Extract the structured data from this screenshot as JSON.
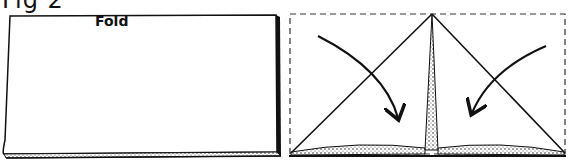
{
  "figure": {
    "title": "Fig 2",
    "panels": [
      {
        "id": "left",
        "description": "Rectangular sheet of paper",
        "label": "Fold"
      },
      {
        "id": "right",
        "description": "Top corners folded down to center forming a triangle; dashed outline shows original rectangle; arrows indicate folding direction"
      }
    ]
  },
  "colors": {
    "ink": "#111111",
    "paper": "#ffffff",
    "stipple": "#555555"
  }
}
